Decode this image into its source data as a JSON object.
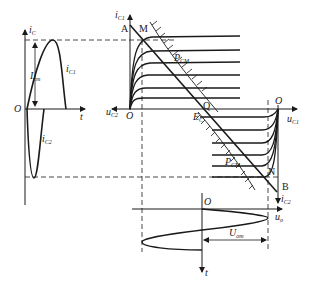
{
  "diagram": {
    "type": "class-B push-pull power amplifier graphical analysis",
    "colors": {
      "stroke": "#1a1a1a",
      "background": "#ffffff"
    },
    "left_waveform": {
      "y_axis": {
        "symbol": "i",
        "subscript": "C"
      },
      "x_axis": {
        "symbol": "t"
      },
      "origin": "O",
      "amplitude_label": {
        "symbol": "I",
        "subscript": "cm"
      },
      "upper_half_label": {
        "symbol": "i",
        "subscript": "C1"
      },
      "lower_half_label": {
        "symbol": "i",
        "subscript": "C2"
      }
    },
    "upper_characteristics": {
      "y_axis": {
        "symbol": "i",
        "subscript": "C1"
      },
      "x_axis": {
        "symbol": "u",
        "subscript": "C2"
      },
      "origin": "O",
      "points": {
        "A": "A",
        "M": "M",
        "Q": "Q"
      },
      "power_hyperbola": {
        "symbol": "P",
        "subscript": "CM"
      }
    },
    "lower_characteristics": {
      "y_axis": {
        "symbol": "i",
        "subscript": "C2"
      },
      "x_axis": {
        "symbol": "u",
        "subscript": "C1"
      },
      "origin": "O",
      "points": {
        "N": "N",
        "B": "B"
      },
      "supply": {
        "symbol": "E",
        "subscript": "C"
      },
      "power_hyperbola": {
        "symbol": "P",
        "subscript": "CM"
      }
    },
    "output_waveform": {
      "x_axis": {
        "symbol": "u",
        "subscript": "o"
      },
      "y_axis": {
        "symbol": "t"
      },
      "origin": "O",
      "amplitude_label": {
        "symbol": "U",
        "subscript": "om"
      }
    }
  }
}
